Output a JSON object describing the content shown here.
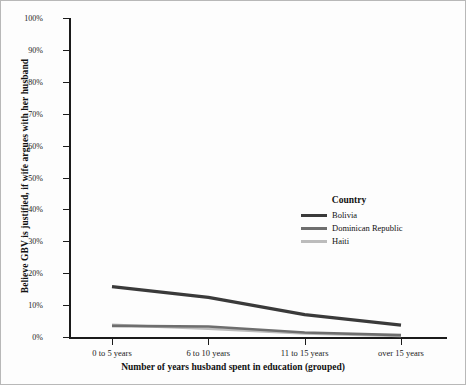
{
  "chart_data": {
    "type": "line",
    "title": "",
    "xlabel": "Number of years husband spent in education (grouped)",
    "ylabel": "Believe GBV is justified, if wife argues with her husband",
    "categories": [
      "0 to 5 years",
      "6 to 10 years",
      "11 to 15 years",
      "over 15 years"
    ],
    "ylim": [
      0,
      100
    ],
    "ytick_labels": [
      "100%",
      "90%",
      "80%",
      "70%",
      "60%",
      "50%",
      "40%",
      "30%",
      "20%",
      "10%",
      "0%"
    ],
    "ytick_values": [
      100,
      90,
      80,
      70,
      60,
      50,
      40,
      30,
      20,
      10,
      0
    ],
    "grid": false,
    "legend_position": "center-right",
    "legend_title": "Country",
    "series": [
      {
        "name": "Bolivia",
        "color": "#3a3a3a",
        "values": [
          15.8,
          12.4,
          7.0,
          3.7
        ]
      },
      {
        "name": "Dominican Republic",
        "color": "#6e6e6e",
        "values": [
          3.5,
          3.3,
          1.4,
          0.6
        ]
      },
      {
        "name": "Haiti",
        "color": "#bcbcbc",
        "values": [
          3.8,
          2.6,
          1.1,
          0.3
        ]
      }
    ]
  },
  "legend": {
    "title": "Country",
    "items": [
      {
        "label": "Bolivia",
        "color": "#3a3a3a"
      },
      {
        "label": "Dominican Republic",
        "color": "#6e6e6e"
      },
      {
        "label": "Haiti",
        "color": "#bcbcbc"
      }
    ]
  },
  "axes": {
    "y_title": "Believe GBV is justified, if wife argues with her husband",
    "x_title": "Number of years husband spent in education (grouped)"
  }
}
